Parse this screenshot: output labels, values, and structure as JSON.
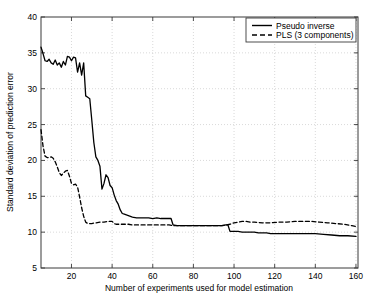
{
  "chart_data": {
    "type": "line",
    "title": "",
    "xlabel": "Number of experiments used for model estimation",
    "ylabel": "Standard deviation of prediction error",
    "xlim": [
      5,
      161
    ],
    "ylim": [
      5,
      40
    ],
    "xticks": [
      20,
      40,
      60,
      80,
      100,
      120,
      140,
      160
    ],
    "yticks": [
      5,
      10,
      15,
      20,
      25,
      30,
      35,
      40
    ],
    "grid": true,
    "legend_position": "top-right",
    "legend_entries": [
      {
        "label": "Pseudo inverse",
        "style": "solid"
      },
      {
        "label": "PLS (3 components)",
        "style": "dashed"
      }
    ],
    "series": [
      {
        "name": "Pseudo inverse",
        "style": "solid",
        "color": "#000000",
        "x": [
          5,
          6,
          7,
          8,
          9,
          10,
          11,
          12,
          13,
          14,
          15,
          16,
          17,
          18,
          19,
          20,
          21,
          22,
          23,
          24,
          25,
          26,
          27,
          28,
          29,
          30,
          31,
          32,
          33,
          34,
          35,
          36,
          37,
          38,
          39,
          40,
          41,
          42,
          43,
          44,
          45,
          46,
          47,
          48,
          50,
          52,
          54,
          56,
          58,
          60,
          62,
          64,
          66,
          68,
          69,
          70,
          72,
          74,
          76,
          78,
          80,
          82,
          84,
          86,
          88,
          90,
          92,
          94,
          96,
          97,
          98,
          100,
          102,
          104,
          106,
          108,
          110,
          112,
          114,
          116,
          118,
          120,
          124,
          128,
          132,
          136,
          140,
          144,
          148,
          152,
          156,
          160
        ],
        "y": [
          35.8,
          34.9,
          33.9,
          33.8,
          34.1,
          33.6,
          33.4,
          34.0,
          33.3,
          33.6,
          33.0,
          33.8,
          33.3,
          34.5,
          34.4,
          33.9,
          34.4,
          34.3,
          32.3,
          33.6,
          31.9,
          33.6,
          29.0,
          28.8,
          28.6,
          25.6,
          22.5,
          20.5,
          20.0,
          19.2,
          16.0,
          16.8,
          18.0,
          17.6,
          16.5,
          16.2,
          15.2,
          14.4,
          13.9,
          13.1,
          12.6,
          12.5,
          12.4,
          12.3,
          12.1,
          12.0,
          12.0,
          12.0,
          12.0,
          11.9,
          12.0,
          11.9,
          11.9,
          11.9,
          11.9,
          11.0,
          10.9,
          10.9,
          10.9,
          10.9,
          10.9,
          10.9,
          10.9,
          10.9,
          10.9,
          10.9,
          10.9,
          10.9,
          11.0,
          11.0,
          10.1,
          10.1,
          10.1,
          10.0,
          10.0,
          10.0,
          10.0,
          9.9,
          9.9,
          9.9,
          9.8,
          9.8,
          9.8,
          9.8,
          9.8,
          9.8,
          9.8,
          9.7,
          9.6,
          9.5,
          9.5,
          9.4
        ]
      },
      {
        "name": "PLS (3 components)",
        "style": "dashed",
        "color": "#000000",
        "x": [
          5,
          6,
          7,
          8,
          9,
          10,
          11,
          12,
          13,
          14,
          15,
          16,
          17,
          18,
          19,
          20,
          21,
          22,
          23,
          24,
          25,
          26,
          27,
          28,
          29,
          30,
          32,
          34,
          36,
          38,
          40,
          41,
          42,
          44,
          46,
          48,
          50,
          52,
          54,
          56,
          58,
          60,
          62,
          64,
          66,
          68,
          70,
          72,
          74,
          76,
          78,
          80,
          82,
          84,
          86,
          88,
          90,
          92,
          94,
          96,
          98,
          100,
          102,
          104,
          106,
          108,
          110,
          114,
          118,
          122,
          126,
          130,
          134,
          138,
          142,
          146,
          150,
          154,
          158,
          160
        ],
        "y": [
          24.3,
          22.0,
          20.6,
          20.4,
          20.4,
          20.5,
          20.3,
          19.8,
          19.1,
          18.3,
          17.9,
          18.2,
          18.5,
          18.6,
          17.8,
          16.8,
          16.6,
          16.7,
          16.3,
          14.9,
          13.4,
          12.2,
          11.4,
          11.2,
          11.2,
          11.2,
          11.3,
          11.4,
          11.4,
          11.5,
          11.5,
          11.2,
          11.1,
          11.1,
          11.1,
          11.1,
          11.0,
          11.0,
          11.0,
          11.0,
          11.0,
          11.0,
          11.0,
          11.0,
          11.0,
          11.0,
          10.9,
          10.9,
          10.9,
          10.9,
          10.9,
          10.9,
          10.9,
          10.9,
          10.9,
          10.9,
          10.9,
          10.9,
          10.9,
          11.0,
          11.1,
          11.3,
          11.4,
          11.5,
          11.5,
          11.4,
          11.4,
          11.3,
          11.3,
          11.4,
          11.4,
          11.5,
          11.5,
          11.5,
          11.4,
          11.3,
          11.2,
          11.1,
          10.9,
          10.8
        ]
      }
    ]
  },
  "axes": {
    "x_tick_labels": [
      "20",
      "40",
      "60",
      "80",
      "100",
      "120",
      "140",
      "160"
    ],
    "y_tick_labels": [
      "5",
      "10",
      "15",
      "20",
      "25",
      "30",
      "35",
      "40"
    ],
    "x_axis_label": "Number of experiments used for model estimation",
    "y_axis_label": "Standard deviation of prediction error"
  },
  "legend": {
    "items": [
      {
        "label": "Pseudo inverse"
      },
      {
        "label": "PLS (3 components)"
      }
    ]
  },
  "colors": {
    "line": "#000000",
    "axis": "#3a3a3a",
    "grid": "#c8c8c8",
    "background": "#ffffff"
  }
}
